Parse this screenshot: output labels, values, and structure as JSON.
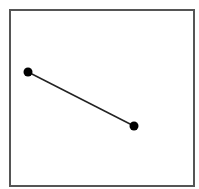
{
  "diagram": {
    "frame": {
      "x": 10,
      "y": 10,
      "width": 184,
      "height": 176,
      "stroke": "#555555",
      "stroke_width": 2
    },
    "points": [
      {
        "id": "point-a",
        "cx": 28,
        "cy": 72,
        "r": 4.5,
        "fill": "#000000"
      },
      {
        "id": "point-b",
        "cx": 134,
        "cy": 126,
        "r": 4.5,
        "fill": "#000000"
      }
    ],
    "segment": {
      "from": "point-a",
      "to": "point-b",
      "stroke": "#222222",
      "stroke_width": 1.5
    }
  }
}
